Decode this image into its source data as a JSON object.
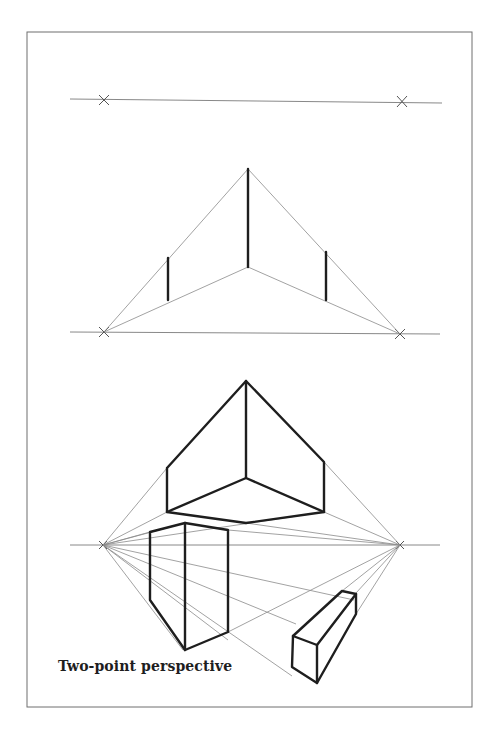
{
  "figure": {
    "caption": "Two-point perspective",
    "colors": {
      "line": "#1e1e1e",
      "guide": "#8a8a8a",
      "frame": "#6f6f6f",
      "background": "#ffffff"
    },
    "panels": [
      {
        "name": "horizon-with-vanishing-points",
        "horizon_y": 100,
        "vanishing_points": [
          [
            104,
            100
          ],
          [
            402,
            101
          ]
        ]
      },
      {
        "name": "vertical-edges-construction",
        "horizon_y": 333,
        "vanishing_points": [
          [
            104,
            332
          ],
          [
            400,
            334
          ]
        ],
        "front_edge": {
          "x": 248,
          "top": 169,
          "bottom": 267
        },
        "side_edges": [
          {
            "x": 168,
            "top": 257,
            "bottom": 300
          },
          {
            "x": 326,
            "top": 251,
            "bottom": 300
          }
        ]
      },
      {
        "name": "boxes-in-perspective",
        "horizon_y": 545,
        "vanishing_points": [
          [
            103,
            545
          ],
          [
            400,
            545
          ]
        ],
        "boxes": [
          "box-above-horizon",
          "tall-box-below-horizon",
          "low-box-below-horizon"
        ]
      }
    ]
  }
}
